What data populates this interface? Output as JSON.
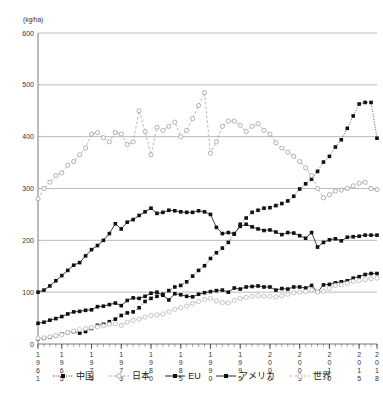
{
  "chart_data": {
    "type": "line",
    "title": "",
    "xlabel": "",
    "ylabel": "",
    "unit_label": "(kg/ha)",
    "ylim": [
      0,
      600
    ],
    "ytick_step": 100,
    "yticks": [
      "0",
      "100",
      "200",
      "300",
      "400",
      "500",
      "600"
    ],
    "grid": true,
    "grid_axis": "y",
    "legend_position": "bottom",
    "xlim": [
      1961,
      2018
    ],
    "xtick_labels": [
      "1961",
      "1965",
      "1970",
      "1975",
      "1980",
      "1985",
      "1990",
      "1995",
      "2000",
      "2005",
      "2010",
      "2015",
      "2018"
    ],
    "x": [
      1961,
      1962,
      1963,
      1964,
      1965,
      1966,
      1967,
      1968,
      1969,
      1970,
      1971,
      1972,
      1973,
      1974,
      1975,
      1976,
      1977,
      1978,
      1979,
      1980,
      1981,
      1982,
      1983,
      1984,
      1985,
      1986,
      1987,
      1988,
      1989,
      1990,
      1991,
      1992,
      1993,
      1994,
      1995,
      1996,
      1997,
      1998,
      1999,
      2000,
      2001,
      2002,
      2003,
      2004,
      2005,
      2006,
      2007,
      2008,
      2009,
      2010,
      2011,
      2012,
      2013,
      2014,
      2015,
      2016,
      2017,
      2018
    ],
    "series": [
      {
        "name": "中国",
        "key": "china",
        "color": "#111111",
        "marker": "filled-square",
        "line_style": "dotted",
        "values": [
          10,
          11,
          13,
          16,
          19,
          22,
          24,
          21,
          24,
          30,
          36,
          38,
          43,
          48,
          55,
          60,
          62,
          70,
          82,
          88,
          92,
          96,
          103,
          110,
          113,
          120,
          131,
          142,
          151,
          165,
          176,
          185,
          196,
          212,
          231,
          243,
          254,
          258,
          262,
          263,
          267,
          271,
          276,
          285,
          299,
          309,
          318,
          333,
          351,
          362,
          380,
          394,
          416,
          440,
          463,
          466,
          466,
          397
        ]
      },
      {
        "name": "日本",
        "key": "japan",
        "color": "#9a9a9a",
        "marker": "open-circle",
        "line_style": "dashed",
        "values": [
          280,
          300,
          312,
          325,
          330,
          345,
          352,
          365,
          378,
          405,
          408,
          398,
          390,
          408,
          405,
          385,
          390,
          450,
          410,
          365,
          418,
          412,
          420,
          428,
          400,
          412,
          435,
          460,
          485,
          368,
          390,
          420,
          430,
          430,
          422,
          410,
          420,
          425,
          412,
          405,
          388,
          378,
          370,
          362,
          352,
          340,
          325,
          300,
          282,
          288,
          295,
          297,
          300,
          305,
          310,
          312,
          300,
          298
        ]
      },
      {
        "name": "EU",
        "key": "eu",
        "color": "#111111",
        "marker": "filled-square",
        "line_style": "solid",
        "values": [
          100,
          104,
          112,
          122,
          132,
          142,
          152,
          157,
          170,
          182,
          190,
          200,
          213,
          232,
          222,
          235,
          240,
          248,
          255,
          262,
          252,
          254,
          258,
          257,
          255,
          254,
          254,
          257,
          255,
          250,
          225,
          213,
          215,
          213,
          227,
          231,
          226,
          222,
          219,
          220,
          216,
          211,
          215,
          214,
          209,
          204,
          215,
          187,
          196,
          201,
          203,
          199,
          206,
          207,
          208,
          210,
          210,
          210
        ]
      },
      {
        "name": "アメリカ",
        "key": "usa",
        "color": "#111111",
        "marker": "filled-square",
        "line_style": "solid",
        "values": [
          40,
          42,
          46,
          49,
          53,
          58,
          62,
          63,
          65,
          66,
          72,
          73,
          76,
          79,
          74,
          84,
          89,
          88,
          92,
          98,
          100,
          94,
          85,
          97,
          95,
          92,
          91,
          96,
          99,
          101,
          103,
          104,
          100,
          108,
          106,
          110,
          111,
          112,
          110,
          110,
          104,
          107,
          106,
          110,
          110,
          108,
          113,
          100,
          114,
          115,
          118,
          120,
          122,
          127,
          130,
          134,
          136,
          136
        ]
      },
      {
        "name": "世界",
        "key": "world",
        "color": "#b3b3b3",
        "marker": "open-circle",
        "line_style": "dashed",
        "values": [
          11,
          12,
          14,
          16,
          18,
          22,
          25,
          28,
          30,
          32,
          33,
          35,
          38,
          39,
          36,
          42,
          46,
          48,
          52,
          55,
          56,
          58,
          62,
          67,
          70,
          73,
          78,
          82,
          86,
          88,
          83,
          80,
          79,
          84,
          88,
          90,
          92,
          93,
          92,
          92,
          91,
          93,
          96,
          99,
          100,
          101,
          104,
          100,
          102,
          107,
          113,
          114,
          117,
          121,
          122,
          124,
          126,
          127
        ]
      }
    ]
  },
  "legend": {
    "items": [
      {
        "label": "中国",
        "marker": "filled-square",
        "line_style": "dotted",
        "color": "#111111"
      },
      {
        "label": "日本",
        "marker": "open-circle",
        "line_style": "dashed",
        "color": "#9a9a9a"
      },
      {
        "label": "EU",
        "marker": "filled-square",
        "line_style": "solid",
        "color": "#111111"
      },
      {
        "label": "アメリカ",
        "marker": "filled-square",
        "line_style": "solid",
        "color": "#111111"
      },
      {
        "label": "世界",
        "marker": "open-circle",
        "line_style": "dashed",
        "color": "#b3b3b3"
      }
    ]
  },
  "axes": {
    "unit_label": "(kg/ha)"
  }
}
